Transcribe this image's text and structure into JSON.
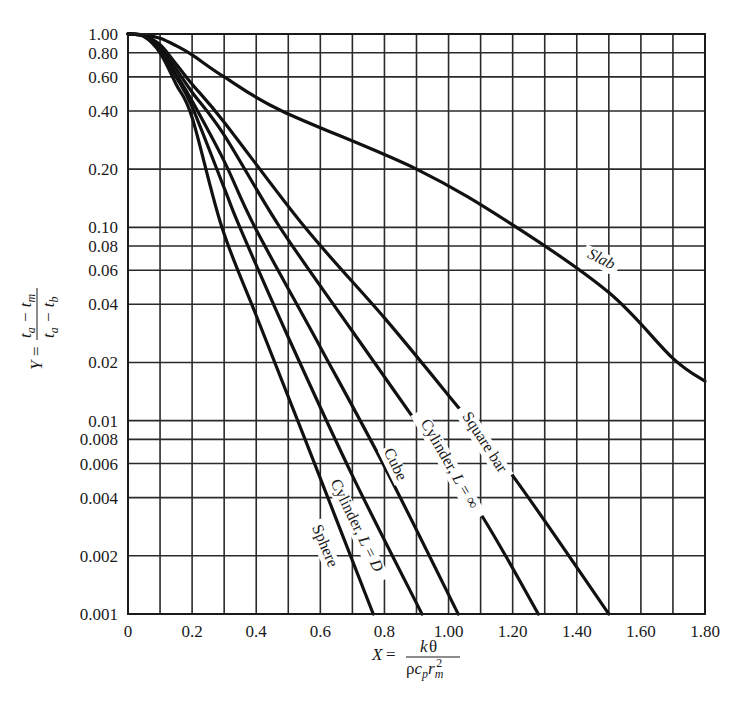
{
  "chart_data": {
    "type": "line",
    "title": "",
    "xlabel": "X = kθ / (ρ c_p r_m²)",
    "ylabel": "Y = (t_a − t_m) / (t_a − t_b)",
    "xscale": "linear",
    "yscale": "log",
    "xlim": [
      0,
      1.8
    ],
    "ylim": [
      0.001,
      1.0
    ],
    "grid": true,
    "legend": "none (inline curve labels)",
    "x_ticks": [
      0,
      0.2,
      0.4,
      0.6,
      0.8,
      1.0,
      1.2,
      1.4,
      1.6,
      1.8
    ],
    "x_tick_labels": [
      "0",
      "0.2",
      "0.4",
      "0.6",
      "0.8",
      "1.00",
      "1.20",
      "1.40",
      "1.60",
      "1.80"
    ],
    "x_minor_gridlines": [
      0.1,
      0.3,
      0.5,
      0.7,
      0.9,
      1.1,
      1.3,
      1.5,
      1.7
    ],
    "y_ticks": [
      1.0,
      0.8,
      0.6,
      0.4,
      0.2,
      0.1,
      0.08,
      0.06,
      0.04,
      0.02,
      0.01,
      0.008,
      0.006,
      0.004,
      0.002,
      0.001
    ],
    "y_tick_labels": [
      "1.00",
      "0.80",
      "0.60",
      "0.40",
      "0.20",
      "0.10",
      "0.08",
      "0.06",
      "0.04",
      "0.02",
      "0.01",
      "0.008",
      "0.006",
      "0.004",
      "0.002",
      "0.001"
    ],
    "series": [
      {
        "name": "Slab",
        "label": "Slab",
        "x": [
          0,
          0.05,
          0.1,
          0.15,
          0.2,
          0.3,
          0.48,
          0.9,
          1.2,
          1.5,
          1.7,
          1.8
        ],
        "y": [
          1.0,
          0.99,
          0.95,
          0.87,
          0.78,
          0.6,
          0.4,
          0.2,
          0.103,
          0.046,
          0.021,
          0.016
        ],
        "label_pos": {
          "x": 1.47,
          "y": 0.065,
          "angle": 26
        }
      },
      {
        "name": "Square bar",
        "label": "Square bar",
        "x": [
          0,
          0.05,
          0.1,
          0.15,
          0.2,
          0.3,
          0.552,
          0.8,
          1.0,
          1.2,
          1.5
        ],
        "y": [
          1.0,
          0.98,
          0.88,
          0.7,
          0.55,
          0.35,
          0.1,
          0.034,
          0.0135,
          0.0052,
          0.001
        ],
        "label_pos": {
          "x": 1.1,
          "y": 0.0075,
          "angle": 57
        }
      },
      {
        "name": "Cylinder, L = ∞",
        "label": "Cylinder, L = ∞",
        "x": [
          0,
          0.05,
          0.1,
          0.15,
          0.2,
          0.3,
          0.474,
          0.7,
          0.9,
          1.1,
          1.28
        ],
        "y": [
          1.0,
          0.98,
          0.86,
          0.66,
          0.5,
          0.3,
          0.1,
          0.029,
          0.0098,
          0.0033,
          0.001
        ],
        "label_pos": {
          "x": 0.99,
          "y": 0.0058,
          "angle": 60
        }
      },
      {
        "name": "Cube",
        "label": "Cube",
        "x": [
          0,
          0.05,
          0.1,
          0.15,
          0.2,
          0.3,
          0.396,
          0.6,
          0.8,
          1.03
        ],
        "y": [
          1.0,
          0.98,
          0.84,
          0.62,
          0.45,
          0.22,
          0.1,
          0.024,
          0.0058,
          0.001
        ],
        "label_pos": {
          "x": 0.82,
          "y": 0.0058,
          "angle": 64
        }
      },
      {
        "name": "Cylinder, L = D",
        "label": "Cylinder, L = D",
        "x": [
          0,
          0.05,
          0.1,
          0.15,
          0.2,
          0.3,
          0.349,
          0.5,
          0.7,
          0.917
        ],
        "y": [
          1.0,
          0.98,
          0.83,
          0.6,
          0.42,
          0.16,
          0.1,
          0.027,
          0.0052,
          0.001
        ],
        "label_pos": {
          "x": 0.7,
          "y": 0.0028,
          "angle": 64
        }
      },
      {
        "name": "Sphere",
        "label": "Sphere",
        "x": [
          0,
          0.05,
          0.1,
          0.15,
          0.2,
          0.293,
          0.4,
          0.55,
          0.765
        ],
        "y": [
          1.0,
          0.97,
          0.8,
          0.55,
          0.37,
          0.1,
          0.035,
          0.0082,
          0.001
        ],
        "label_pos": {
          "x": 0.6,
          "y": 0.0022,
          "angle": 67
        }
      }
    ]
  }
}
